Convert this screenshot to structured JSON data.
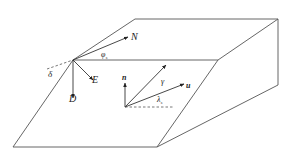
{
  "figure": {
    "labels": {
      "north": "N",
      "east": "E",
      "down": "D",
      "strike_angle": "φ",
      "strike_angle_sub": "s",
      "dip_angle": "δ",
      "normal": "n",
      "slip_vector": "u",
      "gamma": "γ",
      "rake_angle": "λ",
      "rake_angle_sub": "s"
    },
    "colors": {
      "edges": "#555555",
      "vectors": "#333333",
      "text": "#222222"
    }
  }
}
